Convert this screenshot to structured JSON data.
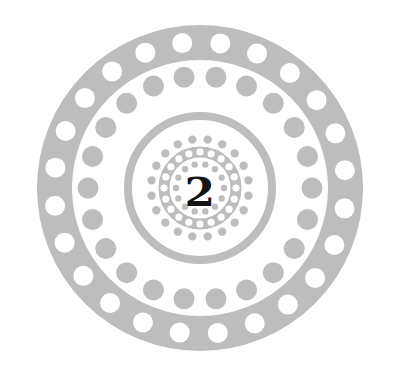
{
  "badge": {
    "numeral": "2",
    "colors": {
      "background": "#ffffff",
      "gray": "#bdbdbd",
      "white": "#ffffff",
      "numeral": "#141414"
    },
    "center": [
      200,
      188
    ],
    "outer_band": {
      "outer_radius": 163,
      "inner_radius": 128
    },
    "rings": [
      {
        "name": "outer-white-dots",
        "radius": 146,
        "count": 24,
        "dot_radius": 10,
        "color": "white",
        "offset_deg": 8
      },
      {
        "name": "gray-dot-ring",
        "radius": 112,
        "count": 22,
        "dot_radius": 10.5,
        "color": "gray",
        "offset_deg": 0
      },
      {
        "name": "small-gray-dot-ring",
        "radius": 49,
        "count": 20,
        "dot_radius": 4.2,
        "color": "gray",
        "offset_deg": 9
      },
      {
        "name": "inner-white-dots",
        "radius": 36,
        "count": 20,
        "dot_radius": 3.6,
        "color": "white",
        "offset_deg": 0
      },
      {
        "name": "innermost-gray-dots",
        "radius": 24,
        "count": 14,
        "dot_radius": 3.2,
        "color": "gray",
        "offset_deg": 0
      }
    ],
    "bands": [
      {
        "name": "middle-band",
        "radius": 72,
        "width": 8
      },
      {
        "name": "inner-band",
        "radius": 36,
        "width": 11
      }
    ]
  }
}
